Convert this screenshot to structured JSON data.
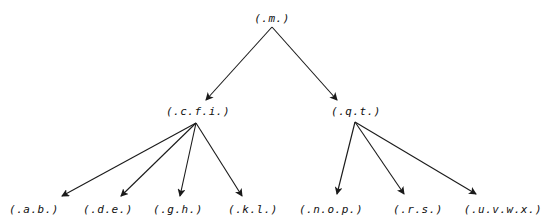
{
  "diagram": {
    "type": "tree",
    "colors": {
      "line": "#1a1a1a",
      "text": "#111111",
      "background": "#ffffff"
    },
    "nodes": {
      "root": {
        "label": "(.m.)",
        "x": 272,
        "y": 18
      },
      "cfi": {
        "label": "(.c.f.i.)",
        "x": 198,
        "y": 111
      },
      "qt": {
        "label": "(.q.t.)",
        "x": 356,
        "y": 111
      },
      "ab": {
        "label": "(.a.b.)",
        "x": 34,
        "y": 209
      },
      "de": {
        "label": "(.d.e.)",
        "x": 108,
        "y": 209
      },
      "gh": {
        "label": "(.g.h.)",
        "x": 178,
        "y": 209
      },
      "kl": {
        "label": "(.k.l.)",
        "x": 253,
        "y": 209
      },
      "nop": {
        "label": "(.n.o.p.)",
        "x": 331,
        "y": 209
      },
      "rs": {
        "label": "(.r.s.)",
        "x": 418,
        "y": 209
      },
      "uvwx": {
        "label": "(.u.v.w.x.)",
        "x": 503,
        "y": 209
      }
    },
    "edges": [
      {
        "from": "root",
        "to": "cfi",
        "x1": 272,
        "y1": 27,
        "x2": 206,
        "y2": 100
      },
      {
        "from": "root",
        "to": "qt",
        "x1": 272,
        "y1": 27,
        "x2": 337,
        "y2": 100
      },
      {
        "from": "cfi",
        "to": "ab",
        "x1": 196,
        "y1": 123,
        "x2": 62,
        "y2": 196
      },
      {
        "from": "cfi",
        "to": "de",
        "x1": 196,
        "y1": 123,
        "x2": 121,
        "y2": 196
      },
      {
        "from": "cfi",
        "to": "gh",
        "x1": 196,
        "y1": 123,
        "x2": 180,
        "y2": 196
      },
      {
        "from": "cfi",
        "to": "kl",
        "x1": 196,
        "y1": 123,
        "x2": 242,
        "y2": 196
      },
      {
        "from": "qt",
        "to": "nop",
        "x1": 355,
        "y1": 122,
        "x2": 337,
        "y2": 194
      },
      {
        "from": "qt",
        "to": "rs",
        "x1": 355,
        "y1": 122,
        "x2": 404,
        "y2": 194
      },
      {
        "from": "qt",
        "to": "uvwx",
        "x1": 355,
        "y1": 122,
        "x2": 476,
        "y2": 194
      }
    ]
  }
}
